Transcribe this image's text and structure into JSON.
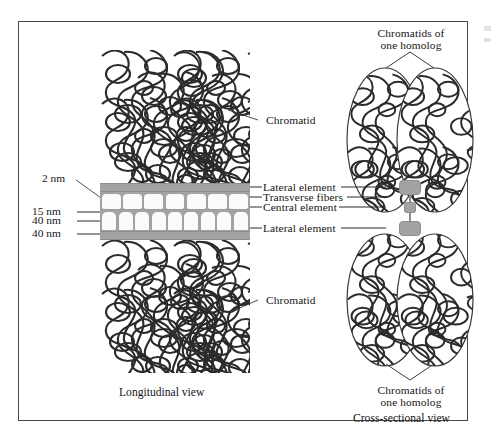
{
  "figure": {
    "title_not_shown": "",
    "background_color": "#ffffff",
    "frame_color": "#45484c",
    "structure_gray": "#a3a3a3",
    "chromatin_stroke": "#2b2b2b"
  },
  "scale_labels": [
    {
      "id": "scale-2nm",
      "text": "2 nm"
    },
    {
      "id": "scale-15nm",
      "text": "15 nm"
    },
    {
      "id": "scale-40nm-upper",
      "text": "40 nm"
    },
    {
      "id": "scale-40nm-lower",
      "text": "40 nm"
    }
  ],
  "longitudinal": {
    "chromatid_top_label": "Chromatid",
    "chromatid_bottom_label": "Chromatid",
    "caption": "Longitudinal view",
    "component_labels": [
      {
        "id": "lateral-element-top",
        "text": "Lateral element"
      },
      {
        "id": "transverse-fibers",
        "text": "Transverse fibers"
      },
      {
        "id": "central-element",
        "text": "Central element"
      },
      {
        "id": "lateral-element-bottom",
        "text": "Lateral element"
      }
    ],
    "transverse_fiber_count_top": 7,
    "transverse_fiber_count_bottom": 9
  },
  "cross_sectional": {
    "caption": "Cross-sectional view",
    "top_label_line1": "Chromatids of",
    "top_label_line2": "one homolog",
    "bottom_label_line1": "Chromatids of",
    "bottom_label_line2": "one homolog",
    "chromatid_ovals": 4
  }
}
